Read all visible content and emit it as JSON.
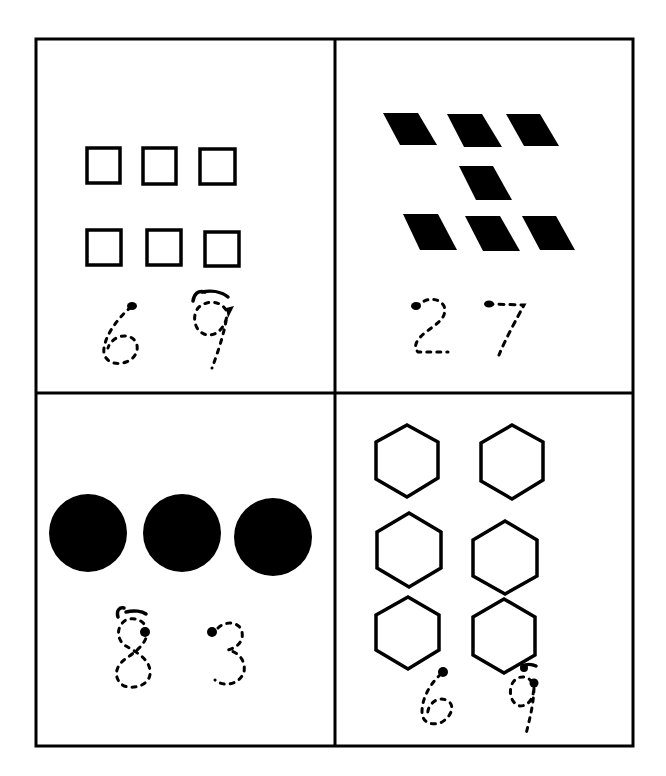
{
  "worksheet": {
    "task": "count shapes and trace the correct number",
    "ink_color": "#000000",
    "paper_color": "#ffffff",
    "panels": [
      {
        "id": "top-left",
        "shape": "square",
        "style": "outline",
        "count": 6,
        "choices": [
          "6",
          "9"
        ]
      },
      {
        "id": "top-right",
        "shape": "parallelogram",
        "style": "filled",
        "count": 7,
        "choices": [
          "2",
          "7"
        ]
      },
      {
        "id": "bottom-left",
        "shape": "circle",
        "style": "filled",
        "count": 3,
        "choices": [
          "8",
          "3"
        ]
      },
      {
        "id": "bottom-right",
        "shape": "hexagon",
        "style": "outline",
        "count": 6,
        "choices": [
          "6",
          "9"
        ]
      }
    ]
  }
}
